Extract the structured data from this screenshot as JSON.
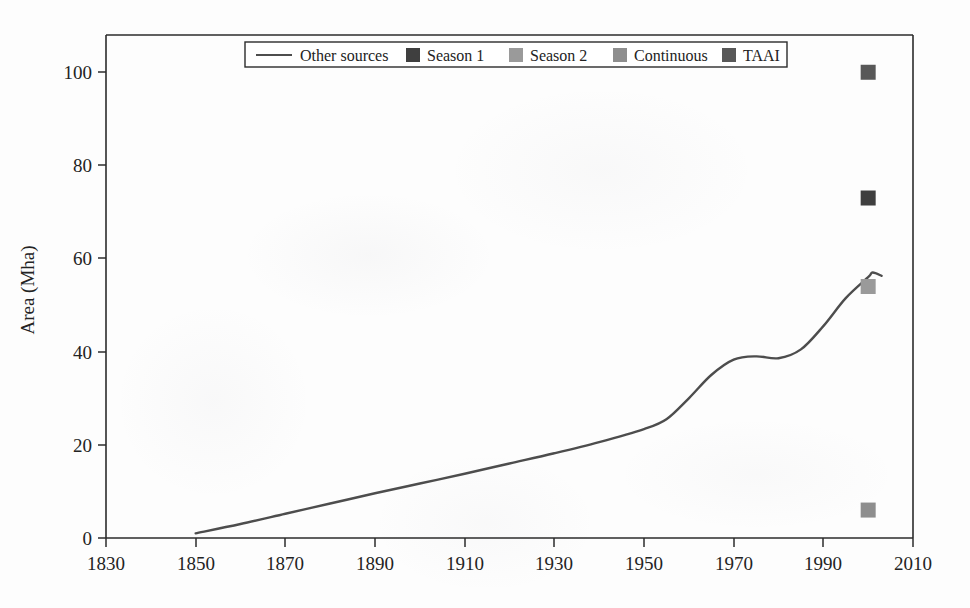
{
  "chart_data": {
    "type": "line",
    "title": "",
    "subtitle": "",
    "xlabel": "",
    "ylabel": "Area (Mha)",
    "xlim": [
      1830,
      2010
    ],
    "ylim": [
      0,
      108
    ],
    "xticks": [
      1830,
      1850,
      1870,
      1890,
      1910,
      1930,
      1950,
      1970,
      1990,
      2010
    ],
    "yticks": [
      0,
      20,
      40,
      60,
      80,
      100
    ],
    "grid": false,
    "legend_position": "top-center",
    "legend": [
      {
        "label": "Other sources",
        "marker": "line",
        "color": "#4d4d4d"
      },
      {
        "label": "Season 1",
        "marker": "square",
        "color": "#3f3f3f"
      },
      {
        "label": "Season 2",
        "marker": "square",
        "color": "#9a9a9a"
      },
      {
        "label": "Continuous",
        "marker": "square",
        "color": "#8e8e8e"
      },
      {
        "label": "TAAI",
        "marker": "square",
        "color": "#585858"
      }
    ],
    "series": [
      {
        "name": "Other sources",
        "type": "line",
        "color": "#4d4d4d",
        "x": [
          1850,
          1860,
          1870,
          1880,
          1890,
          1900,
          1910,
          1920,
          1930,
          1940,
          1950,
          1955,
          1960,
          1965,
          1970,
          1975,
          1980,
          1985,
          1990,
          1995,
          2000,
          2001,
          2003
        ],
        "y": [
          1.0,
          3.0,
          5.2,
          7.4,
          9.6,
          11.7,
          13.8,
          16.0,
          18.2,
          20.6,
          23.4,
          25.5,
          30.0,
          35.0,
          38.3,
          39.0,
          38.6,
          40.5,
          45.5,
          51.5,
          56.0,
          57.0,
          56.3
        ]
      },
      {
        "name": "Season 1",
        "type": "scatter",
        "color": "#3f3f3f",
        "points": [
          {
            "x": 2000,
            "y": 73
          }
        ]
      },
      {
        "name": "Season 2",
        "type": "scatter",
        "color": "#9a9a9a",
        "points": [
          {
            "x": 2000,
            "y": 54
          }
        ]
      },
      {
        "name": "Continuous",
        "type": "scatter",
        "color": "#8e8e8e",
        "points": [
          {
            "x": 2000,
            "y": 6
          }
        ]
      },
      {
        "name": "TAAI",
        "type": "scatter",
        "color": "#585858",
        "points": [
          {
            "x": 2000,
            "y": 100
          }
        ]
      }
    ]
  },
  "axis": {
    "y_title": "Area (Mha)",
    "x_tick_labels": [
      "1830",
      "1850",
      "1870",
      "1890",
      "1910",
      "1930",
      "1950",
      "1970",
      "1990",
      "2010"
    ],
    "y_tick_labels": [
      "0",
      "20",
      "40",
      "60",
      "80",
      "100"
    ]
  },
  "legend": {
    "items": [
      {
        "label": "Other sources",
        "swatch": "line-swatch",
        "color": "#4d4d4d"
      },
      {
        "label": "Season 1",
        "swatch": "square-swatch",
        "color": "#3f3f3f"
      },
      {
        "label": "Season 2",
        "swatch": "square-swatch",
        "color": "#9a9a9a"
      },
      {
        "label": "Continuous",
        "swatch": "square-swatch",
        "color": "#8e8e8e"
      },
      {
        "label": "TAAI",
        "swatch": "square-swatch",
        "color": "#585858"
      }
    ]
  },
  "colors": {
    "axis": "#2b2b2b",
    "line": "#4d4d4d",
    "background": "#fdfdfd",
    "text": "#232323"
  }
}
